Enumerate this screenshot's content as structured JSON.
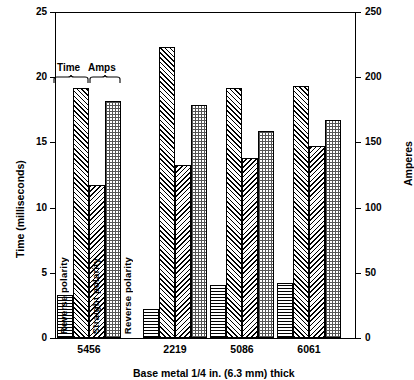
{
  "chart_data": {
    "type": "bar",
    "title": "",
    "xlabel": "Base metal 1/4 in. (6.3 mm) thick",
    "ylabel_left": "Time (milliseconds)",
    "ylabel_right": "Amperes",
    "categories": [
      "5456",
      "2219",
      "5086",
      "6061"
    ],
    "ylim_left": [
      0,
      25
    ],
    "ylim_right": [
      0,
      250
    ],
    "yticks_left": [
      "0",
      "5",
      "10",
      "15",
      "20",
      "25"
    ],
    "yticks_right": [
      "0",
      "50",
      "100",
      "150",
      "200",
      "250"
    ],
    "grid": false,
    "legend": [
      "Time",
      "Amps"
    ],
    "bar_captions": [
      "Reverse polarity",
      "Straight polarity",
      "Straight polarity",
      "Reverse polarity"
    ],
    "series": [
      {
        "name": "Time - Reverse polarity",
        "unit": "milliseconds",
        "axis": "left",
        "pattern": "horizontal-lines",
        "values": [
          3.3,
          2.2,
          4.1,
          4.2
        ]
      },
      {
        "name": "Time - Straight polarity",
        "unit": "milliseconds",
        "axis": "left",
        "pattern": "diagonal-right",
        "values": [
          19.2,
          22.3,
          19.2,
          19.3
        ]
      },
      {
        "name": "Amps - Straight polarity",
        "unit": "amperes",
        "axis": "right",
        "pattern": "diagonal-left",
        "values": [
          117,
          133,
          138,
          147
        ]
      },
      {
        "name": "Amps - Reverse polarity",
        "unit": "amperes",
        "axis": "right",
        "pattern": "dots",
        "values": [
          182,
          179,
          159,
          167
        ]
      }
    ]
  },
  "axes": {
    "left_title": "Time (milliseconds)",
    "right_title": "Amperes",
    "bottom_title": "Base metal 1/4 in. (6.3 mm) thick"
  },
  "legend": {
    "time_label": "Time",
    "amps_label": "Amps"
  },
  "captions": {
    "reverse": "Reverse polarity",
    "straight": "Straight polarity"
  }
}
